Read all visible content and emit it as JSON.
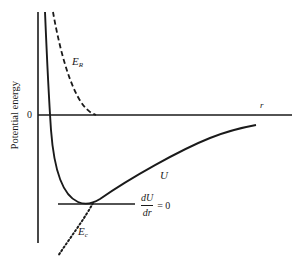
{
  "figure": {
    "y_axis_label": "Potential energy",
    "x_axis_label": "r",
    "zero_label": "0",
    "curves": {
      "total": {
        "label": "U",
        "style": "solid"
      },
      "repulsive": {
        "label": "E",
        "subscript": "R",
        "style": "dashed"
      },
      "attractive": {
        "label": "E",
        "subscript": "c",
        "style": "dotted"
      }
    },
    "equilibrium": {
      "numerator": "dU",
      "denominator": "dr",
      "equals": "= 0"
    }
  },
  "colors": {
    "ink": "#1a1a1a",
    "background": "#ffffff"
  }
}
